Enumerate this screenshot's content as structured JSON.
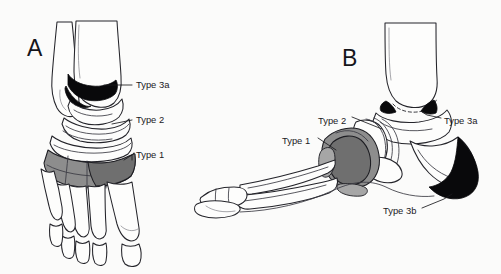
{
  "figure": {
    "background_color": "#fbfbfa",
    "ink_color": "#1a1a1e",
    "shade_colors": {
      "type1_gray": "#8d8d8d",
      "type2_outline": "#fdfdfc",
      "type3_black": "#09090b"
    }
  },
  "panels": [
    {
      "id": "panel-a",
      "letter": "A",
      "view": "anteroposterior-dorsoplantar",
      "annotations": [
        {
          "key": "type3a",
          "label": "Type 3a",
          "shade": "black",
          "label_x": 136,
          "label_y": 85
        },
        {
          "key": "type2",
          "label": "Type 2",
          "shade": "outline",
          "label_x": 136,
          "label_y": 120
        },
        {
          "key": "type1",
          "label": "Type 1",
          "shade": "gray",
          "label_x": 136,
          "label_y": 155
        }
      ]
    },
    {
      "id": "panel-b",
      "letter": "B",
      "view": "lateral",
      "annotations": [
        {
          "key": "type2",
          "label": "Type 2",
          "shade": "outline",
          "label_x": 318,
          "label_y": 121
        },
        {
          "key": "type3a",
          "label": "Type 3a",
          "shade": "black",
          "label_x": 444,
          "label_y": 121
        },
        {
          "key": "type1",
          "label": "Type 1",
          "shade": "gray",
          "label_x": 282,
          "label_y": 141
        },
        {
          "key": "type3b",
          "label": "Type 3b",
          "shade": "black",
          "label_x": 383,
          "label_y": 211
        }
      ]
    }
  ]
}
